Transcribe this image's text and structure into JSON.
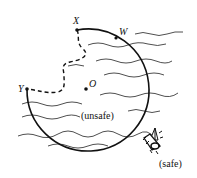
{
  "diagram": {
    "points": {
      "X": "X",
      "W": "W",
      "Y": "Y",
      "O": "O"
    },
    "regions": {
      "unsafe": "(unsafe)",
      "safe": "(safe)"
    },
    "icons": {
      "boat": "boat-icon"
    }
  }
}
